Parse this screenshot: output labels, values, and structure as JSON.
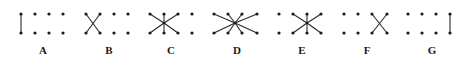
{
  "diagram": {
    "colors": {
      "background": "#ffffff",
      "dot": "#1a1a1a",
      "edge": "#2a2a2a",
      "label": "#1a1a1a"
    },
    "row_y": {
      "top": 14,
      "bottom": 33
    },
    "label_y": 54,
    "panels": [
      {
        "label": "A",
        "label_x": 43,
        "columns_x": [
          21,
          35,
          49,
          63
        ],
        "edges": [
          [
            [
              21,
              14
            ],
            [
              21,
              33
            ]
          ]
        ]
      },
      {
        "label": "B",
        "label_x": 109,
        "columns_x": [
          86,
          100,
          114,
          128
        ],
        "edges": [
          [
            [
              86,
              14
            ],
            [
              100,
              33
            ]
          ],
          [
            [
              100,
              14
            ],
            [
              86,
              33
            ]
          ]
        ]
      },
      {
        "label": "C",
        "label_x": 171,
        "columns_x": [
          150,
          164,
          178,
          192
        ],
        "center": [
          164,
          23
        ],
        "edges": [
          [
            [
              164,
              23
            ],
            [
              150,
              14
            ]
          ],
          [
            [
              164,
              23
            ],
            [
              164,
              14
            ]
          ],
          [
            [
              164,
              23
            ],
            [
              178,
              14
            ]
          ],
          [
            [
              164,
              23
            ],
            [
              150,
              33
            ]
          ],
          [
            [
              164,
              23
            ],
            [
              164,
              33
            ]
          ],
          [
            [
              164,
              23
            ],
            [
              178,
              33
            ]
          ]
        ]
      },
      {
        "label": "D",
        "label_x": 237,
        "columns_x": [
          214,
          228,
          242,
          257
        ],
        "center": [
          235,
          23
        ],
        "edges": [
          [
            [
              235,
              23
            ],
            [
              214,
              14
            ]
          ],
          [
            [
              235,
              23
            ],
            [
              228,
              14
            ]
          ],
          [
            [
              235,
              23
            ],
            [
              242,
              14
            ]
          ],
          [
            [
              235,
              23
            ],
            [
              257,
              14
            ]
          ],
          [
            [
              235,
              23
            ],
            [
              214,
              33
            ]
          ],
          [
            [
              235,
              23
            ],
            [
              228,
              33
            ]
          ],
          [
            [
              235,
              23
            ],
            [
              242,
              33
            ]
          ],
          [
            [
              235,
              23
            ],
            [
              257,
              33
            ]
          ]
        ]
      },
      {
        "label": "E",
        "label_x": 302,
        "columns_x": [
          279,
          293,
          307,
          321
        ],
        "center": [
          307,
          23
        ],
        "edges": [
          [
            [
              307,
              23
            ],
            [
              293,
              14
            ]
          ],
          [
            [
              307,
              23
            ],
            [
              307,
              14
            ]
          ],
          [
            [
              307,
              23
            ],
            [
              321,
              14
            ]
          ],
          [
            [
              307,
              23
            ],
            [
              293,
              33
            ]
          ],
          [
            [
              307,
              23
            ],
            [
              307,
              33
            ]
          ],
          [
            [
              307,
              23
            ],
            [
              321,
              33
            ]
          ]
        ]
      },
      {
        "label": "F",
        "label_x": 367,
        "columns_x": [
          344,
          358,
          372,
          387
        ],
        "edges": [
          [
            [
              372,
              14
            ],
            [
              387,
              33
            ]
          ],
          [
            [
              387,
              14
            ],
            [
              372,
              33
            ]
          ]
        ]
      },
      {
        "label": "G",
        "label_x": 432,
        "columns_x": [
          408,
          422,
          436,
          450
        ],
        "edges": [
          [
            [
              450,
              14
            ],
            [
              450,
              33
            ]
          ]
        ]
      }
    ]
  }
}
